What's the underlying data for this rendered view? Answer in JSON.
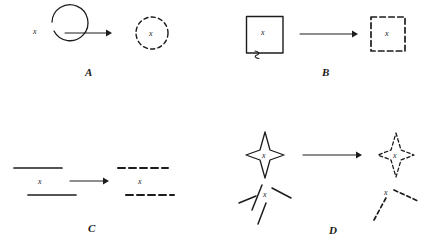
{
  "figure": {
    "background_color": "#ffffff",
    "ink_color": "#1c1c1c",
    "width": 427,
    "height": 246
  },
  "panels": [
    {
      "id": "A",
      "label": "A",
      "label_x": 85,
      "label_y": 66,
      "source": {
        "shape_name": "circle",
        "line_style": "solid",
        "x_label": "x",
        "x_label_x": 33,
        "x_label_y": 28,
        "center_x": 36,
        "center_y": 31,
        "radius": 18
      },
      "arrow": {
        "x1": 65,
        "y1": 33,
        "x2": 110,
        "y2": 33
      },
      "target": {
        "shape_name": "circle",
        "line_style": "dashed",
        "x_label": "x",
        "x_label_x": 149,
        "x_label_y": 30,
        "center_x": 152,
        "center_y": 33,
        "radius": 16
      }
    },
    {
      "id": "B",
      "label": "B",
      "label_x": 322,
      "label_y": 66,
      "source": {
        "shape_name": "square",
        "line_style": "solid",
        "x_label": "x",
        "x_label_x": 261,
        "x_label_y": 29,
        "left": 246,
        "top": 16,
        "size": 37,
        "has_squiggle": true
      },
      "arrow": {
        "x1": 300,
        "y1": 34,
        "x2": 356,
        "y2": 34
      },
      "target": {
        "shape_name": "square",
        "line_style": "dashed",
        "x_label": "x",
        "x_label_x": 385,
        "x_label_y": 30,
        "left": 371,
        "top": 17,
        "size": 34
      }
    },
    {
      "id": "C",
      "label": "C",
      "label_x": 88,
      "label_y": 222,
      "source": {
        "shape_name": "two-horizontal-lines",
        "line_style": "solid",
        "x_label": "x",
        "x_label_x": 38,
        "x_label_y": 178,
        "line1": {
          "x1": 14,
          "y1": 168,
          "x2": 62,
          "y2": 168
        },
        "line2": {
          "x1": 28,
          "y1": 195,
          "x2": 76,
          "y2": 195
        }
      },
      "arrow": {
        "x1": 70,
        "y1": 181,
        "x2": 108,
        "y2": 181
      },
      "target": {
        "shape_name": "two-horizontal-lines",
        "line_style": "dashed",
        "x_label": "x",
        "x_label_x": 138,
        "x_label_y": 178,
        "line1": {
          "x1": 118,
          "y1": 168,
          "x2": 168,
          "y2": 168
        },
        "line2": {
          "x1": 126,
          "y1": 195,
          "x2": 174,
          "y2": 195
        }
      }
    },
    {
      "id": "D",
      "label": "D",
      "label_x": 329,
      "label_y": 224,
      "source": {
        "shape_name": "four-point-star",
        "line_style": "solid",
        "x_label": "x",
        "x_label_x": 262,
        "x_label_y": 152,
        "center_x": 265,
        "center_y": 155,
        "outer_w": 19,
        "outer_h": 23,
        "inner": 7,
        "fragments_x_label": "x",
        "fragments_x_label_x": 263,
        "fragments_x_label_y": 191,
        "fragments": [
          {
            "x1": 252,
            "y1": 210,
            "x2": 262,
            "y2": 185
          },
          {
            "x1": 239,
            "y1": 203,
            "x2": 256,
            "y2": 196
          },
          {
            "x1": 272,
            "y1": 188,
            "x2": 291,
            "y2": 198
          },
          {
            "x1": 258,
            "y1": 224,
            "x2": 266,
            "y2": 203
          }
        ]
      },
      "arrow": {
        "x1": 303,
        "y1": 155,
        "x2": 360,
        "y2": 155
      },
      "target": {
        "shape_name": "four-point-star",
        "line_style": "dashed",
        "x_label": "x",
        "x_label_x": 393,
        "x_label_y": 152,
        "center_x": 396,
        "center_y": 155,
        "outer_w": 18,
        "outer_h": 22,
        "inner": 7,
        "fragments_x_label": "x",
        "fragments_x_label_x": 384,
        "fragments_x_label_y": 189,
        "fragments": [
          {
            "x1": 374,
            "y1": 220,
            "x2": 387,
            "y2": 196
          },
          {
            "x1": 394,
            "y1": 190,
            "x2": 418,
            "y2": 201
          }
        ]
      }
    }
  ]
}
